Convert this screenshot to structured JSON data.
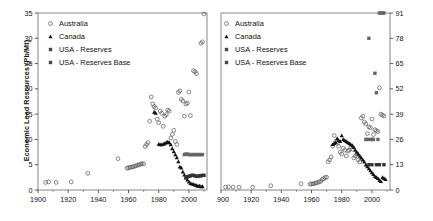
{
  "figure": {
    "width": 433,
    "height": 221,
    "background": "#ffffff",
    "foreground": "#111111"
  },
  "chart_data": [
    {
      "id": "lead-panel",
      "type": "scatter",
      "title": "",
      "xlabel": "",
      "ylabel": "Economic Lead Resources (Pb/Mt)",
      "xlim": [
        1900,
        2012
      ],
      "ylim": [
        0,
        35
      ],
      "xticks": [
        1900,
        1920,
        1940,
        1960,
        1980,
        2000
      ],
      "yticks": [
        0,
        5,
        10,
        15,
        20,
        25,
        30,
        35
      ],
      "grid": false,
      "y_axis_side": "left",
      "legend_position": "top-left",
      "series": [
        {
          "name": "Australia",
          "marker": "open-circle",
          "color": "#555555",
          "points": [
            [
              1905,
              1.5
            ],
            [
              1907,
              1.6
            ],
            [
              1912,
              1.5
            ],
            [
              1922,
              1.6
            ],
            [
              1933,
              3.3
            ],
            [
              1953,
              6.2
            ],
            [
              1959,
              4.3
            ],
            [
              1960,
              4.4
            ],
            [
              1961,
              4.5
            ],
            [
              1962,
              4.5
            ],
            [
              1963,
              4.6
            ],
            [
              1964,
              4.7
            ],
            [
              1965,
              4.8
            ],
            [
              1966,
              4.9
            ],
            [
              1967,
              5.0
            ],
            [
              1968,
              5.1
            ],
            [
              1969,
              5.2
            ],
            [
              1970,
              5.2
            ],
            [
              1971,
              8.6
            ],
            [
              1972,
              9.0
            ],
            [
              1973,
              9.4
            ],
            [
              1974,
              13.6
            ],
            [
              1975,
              18.4
            ],
            [
              1976,
              17.0
            ],
            [
              1977,
              16.5
            ],
            [
              1978,
              16.2
            ],
            [
              1979,
              14.0
            ],
            [
              1980,
              13.3
            ],
            [
              1981,
              15.6
            ],
            [
              1982,
              15.2
            ],
            [
              1983,
              12.6
            ],
            [
              1984,
              14.6
            ],
            [
              1985,
              14.9
            ],
            [
              1986,
              15.8
            ],
            [
              1987,
              15.6
            ],
            [
              1988,
              10.3
            ],
            [
              1989,
              11.0
            ],
            [
              1990,
              11.8
            ],
            [
              1991,
              9.6
            ],
            [
              1992,
              9.0
            ],
            [
              1993,
              19.3
            ],
            [
              1994,
              19.6
            ],
            [
              1995,
              17.9
            ],
            [
              1996,
              17.6
            ],
            [
              1997,
              14.6
            ],
            [
              1998,
              17.0
            ],
            [
              1999,
              17.2
            ],
            [
              2000,
              19.4
            ],
            [
              2001,
              14.7
            ],
            [
              2003,
              23.6
            ],
            [
              2004,
              23.4
            ],
            [
              2005,
              23.0
            ],
            [
              2008,
              29.0
            ],
            [
              2009,
              29.3
            ],
            [
              2010,
              34.8
            ]
          ]
        },
        {
          "name": "Canada",
          "marker": "filled-triangle",
          "color": "#111111",
          "points": [
            [
              1977,
              15.4
            ],
            [
              1978,
              15.2
            ],
            [
              1980,
              9.1
            ],
            [
              1981,
              9.0
            ],
            [
              1982,
              9.0
            ],
            [
              1983,
              9.1
            ],
            [
              1984,
              9.2
            ],
            [
              1985,
              9.4
            ],
            [
              1986,
              9.5
            ],
            [
              1987,
              9.4
            ],
            [
              1988,
              9.0
            ],
            [
              1989,
              8.2
            ],
            [
              1990,
              7.6
            ],
            [
              1991,
              7.0
            ],
            [
              1992,
              6.4
            ],
            [
              1993,
              5.6
            ],
            [
              1994,
              4.6
            ],
            [
              1995,
              4.4
            ],
            [
              1996,
              3.6
            ],
            [
              1997,
              3.0
            ],
            [
              1998,
              2.4
            ],
            [
              1999,
              2.0
            ],
            [
              2000,
              1.6
            ],
            [
              2001,
              1.3
            ],
            [
              2002,
              1.2
            ],
            [
              2003,
              1.1
            ],
            [
              2004,
              1.0
            ],
            [
              2005,
              0.9
            ],
            [
              2006,
              0.8
            ],
            [
              2007,
              0.8
            ],
            [
              2008,
              0.7
            ],
            [
              2009,
              0.7
            ]
          ]
        },
        {
          "name": "USA - Reserves",
          "marker": "filled-square",
          "color": "#333333",
          "points": [
            [
              1998,
              2.5
            ],
            [
              1999,
              2.6
            ],
            [
              2000,
              2.7
            ],
            [
              2001,
              2.8
            ],
            [
              2002,
              2.9
            ],
            [
              2003,
              2.9
            ],
            [
              2004,
              2.8
            ],
            [
              2005,
              2.7
            ],
            [
              2006,
              2.7
            ],
            [
              2007,
              2.8
            ],
            [
              2008,
              2.8
            ],
            [
              2009,
              2.9
            ],
            [
              2010,
              2.9
            ]
          ]
        },
        {
          "name": "USA - Reserves Base",
          "marker": "filled-square",
          "color": "#666666",
          "points": [
            [
              1997,
              7.0
            ],
            [
              1998,
              7.1
            ],
            [
              1999,
              7.1
            ],
            [
              2000,
              7.0
            ],
            [
              2001,
              7.0
            ],
            [
              2002,
              7.0
            ],
            [
              2003,
              7.0
            ],
            [
              2004,
              7.0
            ],
            [
              2005,
              7.0
            ],
            [
              2006,
              7.0
            ],
            [
              2007,
              7.0
            ],
            [
              2008,
              7.0
            ],
            [
              2009,
              7.0
            ]
          ]
        }
      ]
    },
    {
      "id": "zinc-panel",
      "type": "scatter",
      "title": "",
      "xlabel": "",
      "ylabel": "Economic Zinc Resources (Zn/Mt)",
      "xlim": [
        1900,
        2012
      ],
      "ylim": [
        0,
        91
      ],
      "xticks": [
        1900,
        1920,
        1940,
        1960,
        1980,
        2000
      ],
      "yticks": [
        0,
        13,
        26,
        39,
        52,
        65,
        78,
        91
      ],
      "grid": false,
      "y_axis_side": "right",
      "legend_position": "top-left",
      "series": [
        {
          "name": "Australia",
          "marker": "open-circle",
          "color": "#555555",
          "points": [
            [
              1903,
              1.5
            ],
            [
              1905,
              1.6
            ],
            [
              1908,
              1.5
            ],
            [
              1912,
              1.4
            ],
            [
              1921,
              1.4
            ],
            [
              1933,
              2.2
            ],
            [
              1953,
              3.2
            ],
            [
              1959,
              3.0
            ],
            [
              1960,
              3.1
            ],
            [
              1961,
              3.2
            ],
            [
              1962,
              3.4
            ],
            [
              1963,
              3.6
            ],
            [
              1964,
              3.8
            ],
            [
              1965,
              4.2
            ],
            [
              1966,
              4.4
            ],
            [
              1967,
              5.4
            ],
            [
              1968,
              5.8
            ],
            [
              1969,
              6.4
            ],
            [
              1970,
              6.6
            ],
            [
              1971,
              14.5
            ],
            [
              1972,
              15.5
            ],
            [
              1973,
              17.0
            ],
            [
              1974,
              22.5
            ],
            [
              1975,
              28.0
            ],
            [
              1976,
              25.0
            ],
            [
              1977,
              24.0
            ],
            [
              1978,
              22.5
            ],
            [
              1979,
              19.5
            ],
            [
              1980,
              18.5
            ],
            [
              1981,
              21.5
            ],
            [
              1982,
              20.5
            ],
            [
              1983,
              17.5
            ],
            [
              1984,
              20.0
            ],
            [
              1985,
              20.5
            ],
            [
              1986,
              22.0
            ],
            [
              1987,
              21.0
            ],
            [
              1988,
              16.5
            ],
            [
              1989,
              17.5
            ],
            [
              1990,
              18.5
            ],
            [
              1991,
              15.5
            ],
            [
              1992,
              14.5
            ],
            [
              1993,
              37.0
            ],
            [
              1994,
              38.0
            ],
            [
              1995,
              35.0
            ],
            [
              1996,
              34.0
            ],
            [
              1997,
              29.0
            ],
            [
              1998,
              32.5
            ],
            [
              1999,
              32.0
            ],
            [
              2000,
              36.5
            ],
            [
              2001,
              28.5
            ],
            [
              2002,
              31.0
            ],
            [
              2003,
              30.5
            ],
            [
              2004,
              30.0
            ],
            [
              2005,
              52.5
            ],
            [
              2006,
              39.0
            ],
            [
              2007,
              38.5
            ],
            [
              2008,
              38.0
            ]
          ]
        },
        {
          "name": "Canada",
          "marker": "filled-triangle",
          "color": "#111111",
          "points": [
            [
              1974,
              23.5
            ],
            [
              1975,
              24.0
            ],
            [
              1976,
              24.5
            ],
            [
              1977,
              26.5
            ],
            [
              1978,
              25.5
            ],
            [
              1979,
              25.0
            ],
            [
              1980,
              28.0
            ],
            [
              1981,
              26.0
            ],
            [
              1982,
              25.5
            ],
            [
              1983,
              25.0
            ],
            [
              1984,
              24.5
            ],
            [
              1985,
              24.0
            ],
            [
              1986,
              23.5
            ],
            [
              1987,
              23.0
            ],
            [
              1988,
              22.0
            ],
            [
              1989,
              20.5
            ],
            [
              1990,
              19.5
            ],
            [
              1991,
              18.5
            ],
            [
              1992,
              17.5
            ],
            [
              1993,
              16.5
            ],
            [
              1994,
              15.5
            ],
            [
              1995,
              14.5
            ],
            [
              1996,
              13.0
            ],
            [
              1997,
              12.0
            ],
            [
              1998,
              11.0
            ],
            [
              1999,
              10.0
            ],
            [
              2000,
              9.0
            ],
            [
              2001,
              8.0
            ],
            [
              2002,
              7.0
            ],
            [
              2003,
              6.5
            ],
            [
              2004,
              6.0
            ],
            [
              2005,
              5.0
            ],
            [
              2006,
              4.5
            ],
            [
              2007,
              6.5
            ],
            [
              2008,
              6.0
            ],
            [
              2009,
              5.5
            ]
          ]
        },
        {
          "name": "USA - Reserves",
          "marker": "filled-square",
          "color": "#333333",
          "points": [
            [
              1998,
              13.0
            ],
            [
              2000,
              13.0
            ],
            [
              2003,
              13.0
            ],
            [
              2005,
              13.0
            ],
            [
              2008,
              13.0
            ]
          ]
        },
        {
          "name": "USA - Reserves Base",
          "marker": "filled-square",
          "color": "#666666",
          "points": [
            [
              1996,
              26.0
            ],
            [
              1997,
              26.0
            ],
            [
              1998,
              78.0
            ],
            [
              1999,
              26.0
            ],
            [
              2000,
              26.0
            ],
            [
              2001,
              26.0
            ],
            [
              2002,
              60.0
            ],
            [
              2003,
              50.0
            ],
            [
              2004,
              26.0
            ],
            [
              2005,
              91.0
            ],
            [
              2006,
              91.0
            ],
            [
              2007,
              91.0
            ],
            [
              2008,
              91.0
            ]
          ]
        }
      ]
    }
  ],
  "panels": {
    "left": {
      "name": "Economic Lead Resources panel",
      "ylabel": "Economic Lead Resources (Pb/Mt)",
      "legend": [
        {
          "label": "Australia",
          "marker": "open-circle"
        },
        {
          "label": "Canada",
          "marker": "filled-triangle"
        },
        {
          "label": "USA - Reserves",
          "marker": "filled-square"
        },
        {
          "label": "USA - Reserves Base",
          "marker": "filled-square"
        }
      ]
    },
    "right": {
      "name": "Economic Zinc Resources panel",
      "ylabel": "Economic Zinc Resources (Zn/Mt)",
      "legend": [
        {
          "label": "Australia",
          "marker": "open-circle"
        },
        {
          "label": "Canada",
          "marker": "filled-triangle"
        },
        {
          "label": "USA - Reserves",
          "marker": "filled-square"
        },
        {
          "label": "USA - Reserves Base",
          "marker": "filled-square"
        }
      ]
    }
  }
}
